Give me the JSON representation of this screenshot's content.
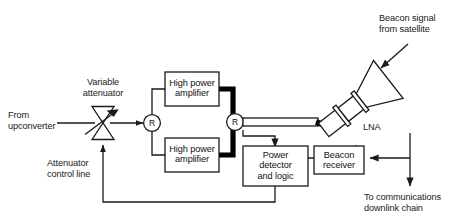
{
  "diagram": {
    "colors": {
      "line": "#1a1a1a",
      "waveguide": "#000000",
      "box_fill": "#ffffff",
      "text": "#1a1a1a",
      "background": "#ffffff"
    },
    "labels": {
      "from_upconverter": "From\nupconverter",
      "variable_attenuator": "Variable\nattenuator",
      "attenuator_control_line": "Attenuator\ncontrol line",
      "beacon_signal": "Beacon signal\nfrom satellite",
      "lna": "LNA",
      "to_comms": "To communications\ndownlink chain"
    },
    "blocks": [
      {
        "id": "hpa-top",
        "label": "High power\namplifier"
      },
      {
        "id": "hpa-bottom",
        "label": "High power\namplifier"
      },
      {
        "id": "power-detector",
        "label": "Power\ndetector\nand logic"
      },
      {
        "id": "beacon-receiver",
        "label": "Beacon\nreceiver"
      }
    ],
    "nodes": [
      {
        "id": "splitter",
        "label": "R"
      },
      {
        "id": "combiner",
        "label": "R"
      }
    ]
  }
}
